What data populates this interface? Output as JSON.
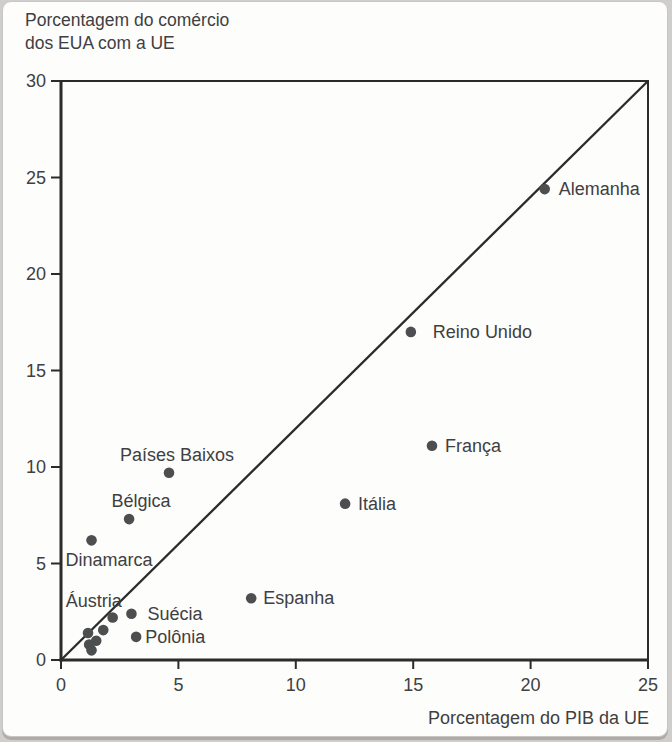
{
  "figure": {
    "title_line1": "Porcentagem do comércio",
    "title_line2": "dos EUA com a UE",
    "x_axis_title": "Porcentagem do PIB da UE"
  },
  "chart_data": {
    "type": "scatter",
    "title": "Porcentagem do comércio dos EUA com a UE",
    "xlabel": "Porcentagem do PIB da UE",
    "ylabel": "Porcentagem do comércio dos EUA com a UE",
    "xlim": [
      0,
      25
    ],
    "ylim": [
      0,
      30
    ],
    "x_ticks": [
      0,
      5,
      10,
      15,
      20,
      25
    ],
    "y_ticks": [
      0,
      5,
      10,
      15,
      20,
      25,
      30
    ],
    "grid": false,
    "legend": null,
    "reference_line": {
      "x1": 0,
      "y1": 0,
      "x2": 25,
      "y2": 30,
      "description": "diagonal reference line from origin to (25,30)"
    },
    "points": [
      {
        "label": "Alemanha",
        "x": 20.6,
        "y": 24.4,
        "label_pos": "right",
        "label_dx": 14
      },
      {
        "label": "Reino Unido",
        "x": 14.9,
        "y": 17.0,
        "label_pos": "right",
        "label_dx": 22
      },
      {
        "label": "França",
        "x": 15.8,
        "y": 11.1,
        "label_pos": "right",
        "label_dx": 13
      },
      {
        "label": "Itália",
        "x": 12.1,
        "y": 8.1,
        "label_pos": "right",
        "label_dx": 13
      },
      {
        "label": "Espanha",
        "x": 8.1,
        "y": 3.2,
        "label_pos": "right",
        "label_dx": 12
      },
      {
        "label": "Países Baixos",
        "x": 4.6,
        "y": 9.7,
        "label_pos": "above",
        "label_dx": 8
      },
      {
        "label": "Bélgica",
        "x": 2.9,
        "y": 7.3,
        "label_pos": "above",
        "label_dx": 12
      },
      {
        "label": "Dinamarca",
        "x": 1.3,
        "y": 6.2,
        "label_pos": "below-left",
        "label_dx": -26
      },
      {
        "label": "Suécia",
        "x": 3.0,
        "y": 2.4,
        "label_pos": "right",
        "label_dx": 16
      },
      {
        "label": "Áustria",
        "x": 2.2,
        "y": 2.2,
        "label_pos": "above-left",
        "label_dx": -47
      },
      {
        "label": "Polônia",
        "x": 3.2,
        "y": 1.2,
        "label_pos": "right",
        "label_dx": 9
      },
      {
        "label": "",
        "x": 1.8,
        "y": 1.55,
        "label_pos": "none"
      },
      {
        "label": "",
        "x": 1.15,
        "y": 1.4,
        "label_pos": "none"
      },
      {
        "label": "",
        "x": 1.5,
        "y": 1.0,
        "label_pos": "none"
      },
      {
        "label": "",
        "x": 1.2,
        "y": 0.8,
        "label_pos": "none"
      },
      {
        "label": "",
        "x": 1.3,
        "y": 0.5,
        "label_pos": "none"
      }
    ],
    "colors": {
      "dot": "#4d4e50",
      "axis": "#2b2b2b",
      "text": "#3f4042"
    }
  }
}
